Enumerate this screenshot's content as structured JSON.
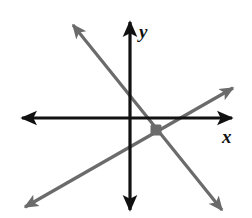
{
  "figure": {
    "background_color": "#ffffff",
    "width": 252,
    "height": 218
  },
  "axes": {
    "x_label": "x",
    "y_label": "y",
    "axis_color": "#111111",
    "axis_thickness": 3,
    "origin_px": {
      "x": 130,
      "y": 118
    },
    "x_axis_extent_px": {
      "from_x": 22,
      "to_x": 232,
      "y": 118
    },
    "y_axis_extent_px": {
      "x": 130,
      "from_y": 22,
      "to_y": 210
    },
    "arrowheads": [
      "left",
      "right",
      "up",
      "down"
    ],
    "ticks": [],
    "gridlines": false
  },
  "chart_data": {
    "type": "line",
    "xlabel": "x",
    "ylabel": "y",
    "grid": false,
    "legend": false,
    "axis_arrows": true,
    "origin_px": {
      "x": 130,
      "y": 118
    },
    "series": [
      {
        "name": "line-negative-slope",
        "color": "#6b6b6b",
        "thickness": 3,
        "arrows": "both",
        "direction": "decreasing",
        "endpoints_px": [
          {
            "x": 73,
            "y": 25
          },
          {
            "x": 222,
            "y": 210
          }
        ]
      },
      {
        "name": "line-positive-slope",
        "color": "#6b6b6b",
        "thickness": 3,
        "arrows": "both",
        "direction": "increasing",
        "endpoints_px": [
          {
            "x": 25,
            "y": 207
          },
          {
            "x": 233,
            "y": 88
          }
        ]
      }
    ],
    "points": [
      {
        "name": "intersection-point",
        "color": "#6b6b6b",
        "size_px": 11,
        "position_px": {
          "x": 156,
          "y": 130
        },
        "label": ""
      }
    ]
  },
  "colors": {
    "axis": "#111111",
    "line": "#6b6b6b",
    "point": "#6b6b6b",
    "background": "#ffffff"
  }
}
